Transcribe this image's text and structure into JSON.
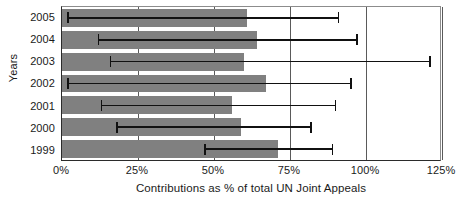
{
  "chart_data": {
    "type": "bar",
    "orientation": "horizontal",
    "title": "",
    "xlabel": "Contributions as % of total UN Joint Appeals",
    "ylabel": "Years",
    "categories": [
      "2005",
      "2004",
      "2003",
      "2002",
      "2001",
      "2000",
      "1999"
    ],
    "values": [
      61,
      64,
      60,
      67,
      56,
      59,
      71
    ],
    "error_bars": [
      {
        "category": "2005",
        "low": 2,
        "high": 91
      },
      {
        "category": "2004",
        "low": 12,
        "high": 97
      },
      {
        "category": "2003",
        "low": 16,
        "high": 121
      },
      {
        "category": "2002",
        "low": 2,
        "high": 95
      },
      {
        "category": "2001",
        "low": 13,
        "high": 90
      },
      {
        "category": "2000",
        "low": 18,
        "high": 82
      },
      {
        "category": "1999",
        "low": 47,
        "high": 89
      }
    ],
    "xlim": [
      0,
      125
    ],
    "xticks": [
      0,
      25,
      50,
      75,
      100,
      125
    ],
    "xtick_labels": [
      "0%",
      "25%",
      "50%",
      "75%",
      "100%",
      "125%"
    ],
    "grid": true,
    "grid_axis": "x",
    "legend": null,
    "colors": {
      "bar": "#808080",
      "error_bar": "#111111",
      "gridline": "#5a5a5a",
      "axis": "#2b2b2b",
      "text": "#1a1a1a",
      "background": "#ffffff"
    }
  }
}
